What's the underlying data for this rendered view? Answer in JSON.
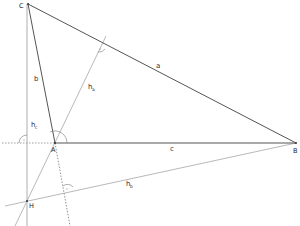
{
  "diagram": {
    "vertices": {
      "C": {
        "label": "C",
        "x": 28,
        "y": 4
      },
      "A": {
        "label": "A",
        "x": 55,
        "y": 143
      },
      "B": {
        "label": "B",
        "x": 296,
        "y": 143
      },
      "H": {
        "label": "H",
        "x": 27,
        "y": 201
      }
    },
    "sides": {
      "a": {
        "label": "a"
      },
      "b": {
        "label": "b"
      },
      "c": {
        "label": "c"
      }
    },
    "altitudes": {
      "hc": {
        "main": "h",
        "sub": "c"
      },
      "ha": {
        "main": "h",
        "sub": "a"
      },
      "hb": {
        "main": "h",
        "sub": "b"
      }
    },
    "colors": {
      "triangle": "#555555",
      "altitude": "#8a8a8a",
      "dashed": "#777777"
    }
  }
}
